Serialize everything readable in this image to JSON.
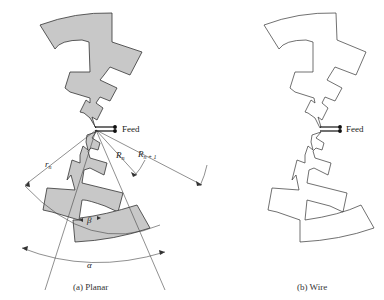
{
  "panel_a": {
    "caption": "(a)  Planar",
    "feed_label": "Feed",
    "labels": {
      "r_n": "r",
      "r_n_sub": "n",
      "R_n": "R",
      "R_n_sub": "n",
      "R_n1": "R",
      "R_n1_sub": "n + 1",
      "beta": "β",
      "alpha": "α"
    },
    "fill_color": "#c8c8c8",
    "stroke_color": "#333333"
  },
  "panel_b": {
    "caption": "(b)  Wire",
    "feed_label": "Feed",
    "fill_color": "#ffffff",
    "stroke_color": "#333333"
  }
}
